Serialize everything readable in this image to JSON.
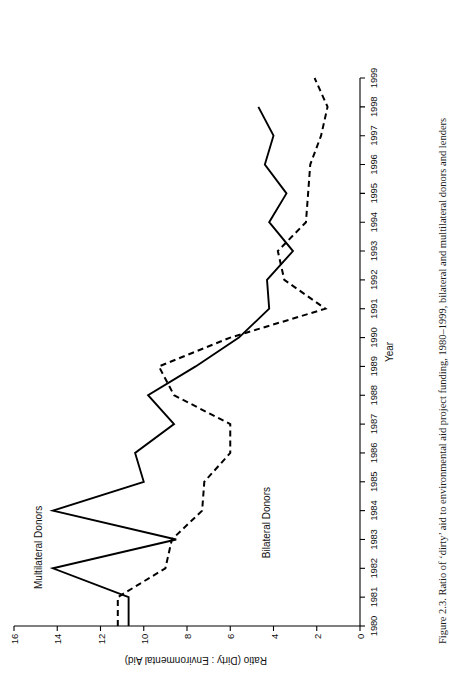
{
  "figure": {
    "caption": "Figure 2.3.  Ratio of ‘dirty’ aid to environmental aid project funding, 1980–1999, bilateral and multilateral donors and lenders",
    "orientation": "rotated-90-ccw",
    "page_background": "#ffffff",
    "ink_color": "#000000"
  },
  "labels": {
    "multilateral": "Multilateral Donors",
    "bilateral": "Bilateral Donors",
    "x_axis_title": "Year",
    "y_axis_title": "Ratio (Dirty : Environmental Aid)"
  },
  "chart_data": {
    "type": "line",
    "title": "",
    "subtitle": "",
    "xlabel": "Year",
    "ylabel": "Ratio (Dirty : Environmental Aid)",
    "grid": false,
    "legend_position": "inline-annotation",
    "xlim": [
      1980,
      1999
    ],
    "ylim": [
      0,
      16
    ],
    "ytick_step": 2,
    "yticks": [
      0,
      2,
      4,
      6,
      8,
      10,
      12,
      14,
      16
    ],
    "ytick_labels": [
      "0",
      "2",
      "4",
      "6",
      "8",
      "10",
      "12",
      "14",
      "16"
    ],
    "x": [
      1980,
      1981,
      1982,
      1983,
      1984,
      1985,
      1986,
      1987,
      1988,
      1989,
      1990,
      1991,
      1992,
      1993,
      1994,
      1995,
      1996,
      1997,
      1998,
      1999
    ],
    "xtick_labels": [
      "1980",
      "1981",
      "1982",
      "1983",
      "1984",
      "1985",
      "1986",
      "1987",
      "1988",
      "1989",
      "1990",
      "1991",
      "1992",
      "1993",
      "1994",
      "1995",
      "1996",
      "1997",
      "1998",
      "1999"
    ],
    "series": [
      {
        "name": "Multilateral Donors",
        "style": "solid",
        "color": "#000000",
        "label_at": 1983,
        "values": [
          10.7,
          10.7,
          14.2,
          8.5,
          14.2,
          10.0,
          10.4,
          8.6,
          9.8,
          7.6,
          5.6,
          4.2,
          4.3,
          3.1,
          4.2,
          3.4,
          4.4,
          4.0,
          4.7,
          null
        ]
      },
      {
        "name": "Bilateral Donors",
        "style": "dashed",
        "color": "#000000",
        "label_at": 1984,
        "values": [
          11.2,
          11.2,
          9.0,
          8.7,
          7.3,
          7.2,
          6.0,
          6.0,
          8.6,
          9.3,
          6.0,
          1.6,
          3.5,
          3.8,
          2.5,
          2.4,
          2.3,
          1.8,
          1.5,
          2.1
        ]
      }
    ]
  }
}
